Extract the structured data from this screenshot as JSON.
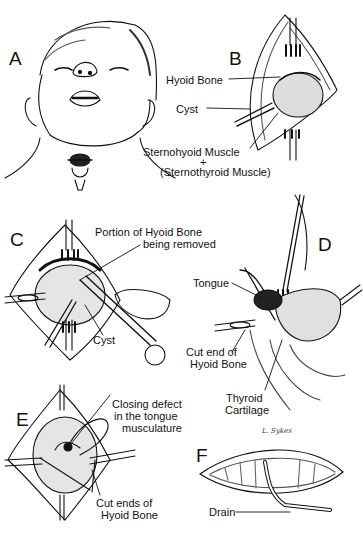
{
  "figure": {
    "signature": "L. Sykes",
    "panels": [
      {
        "id": "A",
        "letter": "A",
        "labels": []
      },
      {
        "id": "B",
        "letter": "B",
        "labels": [
          {
            "text": "Hyoid Bone"
          },
          {
            "text": "Cyst"
          },
          {
            "text": "Sternohyoid Muscle"
          },
          {
            "text": "+"
          },
          {
            "text": "(Sternothyroid Muscle)"
          }
        ]
      },
      {
        "id": "C",
        "letter": "C",
        "labels": [
          {
            "text": "Portion of Hyoid Bone"
          },
          {
            "text": "being removed"
          },
          {
            "text": "Cyst"
          }
        ]
      },
      {
        "id": "D",
        "letter": "D",
        "labels": [
          {
            "text": "Tongue"
          },
          {
            "text": "Cut end of"
          },
          {
            "text": "Hyoid Bone"
          },
          {
            "text": "Thyroid"
          },
          {
            "text": "Cartilage"
          }
        ]
      },
      {
        "id": "E",
        "letter": "E",
        "labels": [
          {
            "text": "Closing defect"
          },
          {
            "text": "in the tongue"
          },
          {
            "text": "musculature"
          },
          {
            "text": "Cut ends of"
          },
          {
            "text": "Hyoid Bone"
          }
        ]
      },
      {
        "id": "F",
        "letter": "F",
        "labels": [
          {
            "text": "Drain"
          }
        ]
      }
    ]
  },
  "colors": {
    "ink": "#111111",
    "paper": "#ffffff",
    "shade": "#555555"
  }
}
